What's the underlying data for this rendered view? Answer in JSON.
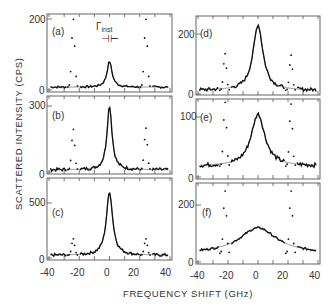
{
  "figure": {
    "ylabel": "SCATTERED INTENSITY (CPS)",
    "xlabel": "FREQUENCY SHIFT (GHz)",
    "instrument_label": "Γinst",
    "instrument_symbol": "⊣⊢"
  },
  "chart_data": [
    {
      "type": "scatter",
      "panel": "(a)",
      "xlabel": "FREQUENCY SHIFT (GHz)",
      "ylabel": "SCATTERED INTENSITY (CPS)",
      "xlim": [
        -40,
        40
      ],
      "ylim": [
        0,
        200
      ],
      "yticks": [
        0,
        200
      ],
      "xticks": [
        -40,
        -30,
        -20,
        -10,
        0,
        10,
        20,
        30,
        40
      ],
      "central_peak": {
        "x": 0,
        "height": 80,
        "width": 4,
        "baseline": 8
      },
      "brillouin_peaks": [
        {
          "x": -24,
          "height": 200
        },
        {
          "x": 24,
          "height": 200
        }
      ],
      "annotation": "Γinst"
    },
    {
      "type": "scatter",
      "panel": "(b)",
      "xlim": [
        -40,
        40
      ],
      "ylim": [
        0,
        300
      ],
      "yticks": [
        0,
        300
      ],
      "central_peak": {
        "x": 0,
        "height": 300,
        "width": 4,
        "baseline": 10
      },
      "brillouin_peaks": [
        {
          "x": -24,
          "height": 195
        },
        {
          "x": 24,
          "height": 200
        }
      ]
    },
    {
      "type": "scatter",
      "panel": "(c)",
      "xlim": [
        -40,
        40
      ],
      "ylim": [
        0,
        600
      ],
      "yticks": [
        0,
        500
      ],
      "xticks_labels": [
        -40,
        -20,
        0,
        20,
        40
      ],
      "central_peak": {
        "x": 0,
        "height": 600,
        "width": 5,
        "baseline": 25
      },
      "brillouin_peaks": [
        {
          "x": -24,
          "height": 175
        },
        {
          "x": 24,
          "height": 175
        }
      ]
    },
    {
      "type": "scatter",
      "panel": "(d)",
      "xlim": [
        -40,
        40
      ],
      "ylim": [
        0,
        240
      ],
      "yticks": [
        0,
        200
      ],
      "central_peak": {
        "x": 0,
        "height": 230,
        "width": 8,
        "baseline": 12
      },
      "brillouin_peaks": [
        {
          "x": -22,
          "height": 135
        },
        {
          "x": 22,
          "height": 130
        }
      ]
    },
    {
      "type": "scatter",
      "panel": "(e)",
      "xlim": [
        -40,
        40
      ],
      "ylim": [
        0,
        130
      ],
      "yticks": [
        0,
        100
      ],
      "central_peak": {
        "x": 0,
        "height": 105,
        "width": 11,
        "baseline": 18
      },
      "brillouin_peaks": [
        {
          "x": -22,
          "height": 125
        },
        {
          "x": 22,
          "height": 122
        }
      ]
    },
    {
      "type": "scatter",
      "panel": "(f)",
      "xlim": [
        -40,
        40
      ],
      "ylim": [
        0,
        260
      ],
      "yticks": [
        0,
        200
      ],
      "xticks_labels": [
        -40,
        -20,
        0,
        20,
        40
      ],
      "central_peak": {
        "x": 0,
        "height": 120,
        "width": 30,
        "baseline": 30
      },
      "brillouin_peaks": [
        {
          "x": -22,
          "height": 250
        },
        {
          "x": 22,
          "height": 250
        }
      ]
    }
  ],
  "panels": [
    {
      "label": "(a)",
      "ytop": "200",
      "ybot": "0"
    },
    {
      "label": "(b)",
      "ytop": "300",
      "ybot": "0"
    },
    {
      "label": "(c)",
      "ytop": "500",
      "ybot": "0"
    },
    {
      "label": "(d)",
      "ytop": "200",
      "ybot": "0"
    },
    {
      "label": "(e)",
      "ytop": "100",
      "ybot": "0"
    },
    {
      "label": "(f)",
      "ytop": "200",
      "ybot": "0"
    }
  ],
  "xtick_labels": [
    "-40",
    "-20",
    "0",
    "20",
    "40"
  ]
}
